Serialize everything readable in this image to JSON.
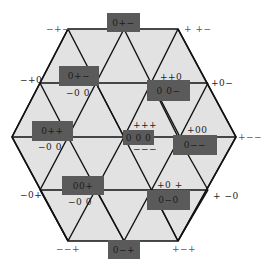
{
  "colors": {
    "fill": "#e2e2e2",
    "stroke": "#111111",
    "box": "#5a5a5a",
    "background": "#ffffff"
  },
  "boxes": [
    {
      "id": "top",
      "text": "0+−"
    },
    {
      "id": "upper-left",
      "text": "0+−"
    },
    {
      "id": "upper-right",
      "text": "0 0−"
    },
    {
      "id": "left",
      "text": "0++"
    },
    {
      "id": "center",
      "text": "0 0 0"
    },
    {
      "id": "right",
      "text": "0−−"
    },
    {
      "id": "lower-left",
      "text": "00+"
    },
    {
      "id": "lower-right",
      "text": "0−0"
    },
    {
      "id": "bottom",
      "text": "0−+"
    }
  ],
  "labels": [
    {
      "id": "top-left-vertex",
      "text": "−+−"
    },
    {
      "id": "top-right-vertex",
      "text": "+ +−"
    },
    {
      "id": "upper-left-vertex",
      "text": "−+0"
    },
    {
      "id": "upper-left-below",
      "text": "−0 0"
    },
    {
      "id": "upper-right-above",
      "text": "++0"
    },
    {
      "id": "upper-right-vertex",
      "text": "+0−"
    },
    {
      "id": "left-below",
      "text": "−0 0"
    },
    {
      "id": "center-above",
      "text": "+++"
    },
    {
      "id": "center-below",
      "text": "−−−"
    },
    {
      "id": "right-above",
      "text": "+00"
    },
    {
      "id": "right-vertex",
      "text": "+−−"
    },
    {
      "id": "lower-left-vertex",
      "text": "−0+"
    },
    {
      "id": "lower-left-below",
      "text": "−0 0"
    },
    {
      "id": "lower-right-above",
      "text": "+0 +"
    },
    {
      "id": "lower-right-vertex",
      "text": "+ −0"
    },
    {
      "id": "bottom-left-vertex",
      "text": "−−+"
    },
    {
      "id": "bottom-right-vertex",
      "text": "+−+"
    }
  ]
}
